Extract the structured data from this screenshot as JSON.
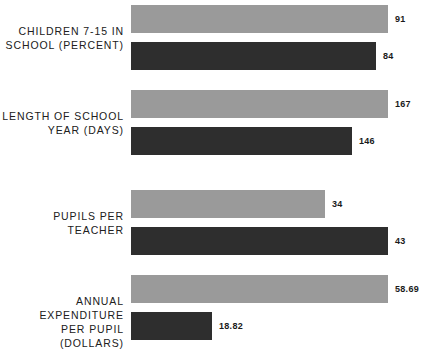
{
  "chart_data": {
    "type": "bar",
    "title": "",
    "subtitle": "",
    "xlabel": "",
    "ylabel": "",
    "orientation": "horizontal",
    "grid": false,
    "legend": "none",
    "note": "Four independent paired-bar panels; each metric uses its own horizontal scale. Light gray bar is plotted above the dark bar in every pair.",
    "series": [
      {
        "name": "light-series",
        "color": "#9a9a9a",
        "values": [
          91,
          167,
          34,
          58.69
        ]
      },
      {
        "name": "dark-series",
        "color": "#2e2e2e",
        "values": [
          84,
          146,
          43,
          18.82
        ]
      }
    ],
    "categories": [
      "CHILDREN 7-15 IN SCHOOL (PERCENT)",
      "LENGTH OF SCHOOL YEAR (DAYS)",
      "PUPILS PER TEACHER",
      "ANNUAL EXPENDITURE PER PUPIL (DOLLARS)"
    ],
    "groups": [
      {
        "label": "CHILDREN 7-15 IN\nSCHOOL (PERCENT)",
        "unit": "percent",
        "bars": [
          {
            "series": "light-series",
            "value": 91,
            "value_label": "91",
            "width_px": 257
          },
          {
            "series": "dark-series",
            "value": 84,
            "value_label": "84",
            "width_px": 245
          }
        ]
      },
      {
        "label": "LENGTH OF SCHOOL\nYEAR (DAYS)",
        "unit": "days",
        "bars": [
          {
            "series": "light-series",
            "value": 167,
            "value_label": "167",
            "width_px": 257
          },
          {
            "series": "dark-series",
            "value": 146,
            "value_label": "146",
            "width_px": 221
          }
        ]
      },
      {
        "label": "PUPILS PER\nTEACHER",
        "unit": "pupils",
        "bars": [
          {
            "series": "light-series",
            "value": 34,
            "value_label": "34",
            "width_px": 194
          },
          {
            "series": "dark-series",
            "value": 43,
            "value_label": "43",
            "width_px": 257
          }
        ]
      },
      {
        "label": "ANNUAL EXPENDITURE\nPER PUPIL (DOLLARS)",
        "unit": "dollars",
        "bars": [
          {
            "series": "light-series",
            "value": 58.69,
            "value_label": "58.69",
            "width_px": 257
          },
          {
            "series": "dark-series",
            "value": 18.82,
            "value_label": "18.82",
            "width_px": 81
          }
        ]
      }
    ]
  },
  "colors": {
    "light_bar": "#9a9a9a",
    "dark_bar": "#2e2e2e",
    "background": "#ffffff",
    "text": "#202020"
  }
}
